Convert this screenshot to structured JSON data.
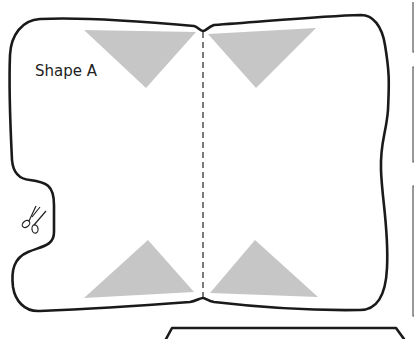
{
  "template": {
    "shape_label": "Shape A",
    "fold_line": "dashed vertical center fold",
    "cut_icon": "scissors-icon",
    "triangle_color": "#c6c6c6",
    "outline_color": "#1a1a1a",
    "triangles": [
      {
        "position": "top-left",
        "points": "84,30 196,32 144,88"
      },
      {
        "position": "top-right",
        "points": "208,34 316,28 256,88"
      },
      {
        "position": "bottom-left",
        "points": "84,297 194,292 148,240"
      },
      {
        "position": "bottom-right",
        "points": "210,292 318,297 255,240"
      }
    ]
  }
}
